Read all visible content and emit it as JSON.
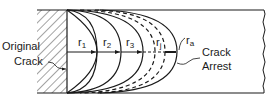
{
  "diagram": {
    "labels": {
      "original_crack_line1": "Original",
      "original_crack_line2": "Crack",
      "crack_arrest_line1": "Crack",
      "crack_arrest_line2": "Arrest"
    },
    "radii": [
      {
        "main": "r",
        "sub": "1"
      },
      {
        "main": "r",
        "sub": "2"
      },
      {
        "main": "r",
        "sub": "3"
      },
      {
        "main": "r",
        "sub": "j"
      },
      {
        "main": "r",
        "sub": "a"
      }
    ],
    "colors": {
      "ink": "#1a1a1a",
      "background": "#ffffff"
    }
  }
}
